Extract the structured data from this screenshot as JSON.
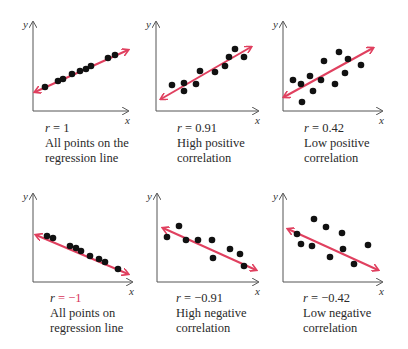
{
  "colors": {
    "regression_line": "#e0405f",
    "points": "#111111",
    "axes": "#555555",
    "accent_text": "#d8345a"
  },
  "chart_data": [
    {
      "type": "scatter",
      "title": "",
      "xlabel": "x",
      "ylabel": "y",
      "r_label": "r = 1",
      "r_value": 1,
      "caption": [
        "All points on the",
        "regression line"
      ],
      "regression": "positive, all points on line",
      "points": [
        [
          45,
          87
        ],
        [
          58,
          81
        ],
        [
          63,
          79
        ],
        [
          72,
          74
        ],
        [
          80,
          71
        ],
        [
          86,
          69
        ],
        [
          91,
          66
        ],
        [
          108,
          58
        ],
        [
          115,
          55
        ]
      ],
      "line": [
        [
          35,
          92
        ],
        [
          128,
          50
        ]
      ],
      "axes": {
        "origin": [
          33,
          111
        ],
        "ytop": 22,
        "xright": 128
      }
    },
    {
      "type": "scatter",
      "xlabel": "x",
      "ylabel": "y",
      "r_label": "r = 0.91",
      "r_value": 0.91,
      "caption": [
        "High positive",
        "correlation"
      ],
      "points": [
        [
          172,
          85
        ],
        [
          184,
          83
        ],
        [
          184,
          91
        ],
        [
          196,
          84
        ],
        [
          200,
          71
        ],
        [
          215,
          72
        ],
        [
          225,
          66
        ],
        [
          229,
          57
        ],
        [
          235,
          49
        ],
        [
          244,
          57
        ]
      ],
      "line": [
        [
          161,
          99
        ],
        [
          251,
          47
        ]
      ],
      "axes": {
        "origin": [
          156,
          111
        ],
        "ytop": 22,
        "xright": 258
      }
    },
    {
      "type": "scatter",
      "xlabel": "x",
      "ylabel": "y",
      "r_label": "r = 0.42",
      "r_value": 0.42,
      "caption": [
        "Low positive",
        "correlation"
      ],
      "points": [
        [
          293,
          80
        ],
        [
          301,
          84
        ],
        [
          302,
          102
        ],
        [
          310,
          76
        ],
        [
          313,
          91
        ],
        [
          321,
          80
        ],
        [
          324,
          61
        ],
        [
          335,
          84
        ],
        [
          339,
          52
        ],
        [
          345,
          73
        ],
        [
          348,
          59
        ],
        [
          361,
          65
        ]
      ],
      "line": [
        [
          284,
          97
        ],
        [
          373,
          48
        ]
      ],
      "axes": {
        "origin": [
          283,
          111
        ],
        "ytop": 22,
        "xright": 382
      }
    },
    {
      "type": "scatter",
      "xlabel": "x",
      "ylabel": "y",
      "r_label": "r = −1",
      "r_value": -1,
      "caption": [
        "All points on",
        "regression line"
      ],
      "points": [
        [
          47,
          236
        ],
        [
          53,
          238
        ],
        [
          70,
          246
        ],
        [
          76,
          248
        ],
        [
          81,
          251
        ],
        [
          90,
          256
        ],
        [
          99,
          259
        ],
        [
          105,
          262
        ],
        [
          118,
          269
        ]
      ],
      "line": [
        [
          36,
          235
        ],
        [
          128,
          274
        ]
      ],
      "axes": {
        "origin": [
          33,
          282
        ],
        "ytop": 194,
        "xright": 132
      }
    },
    {
      "type": "scatter",
      "xlabel": "x",
      "ylabel": "y",
      "r_label": "r = −0.91",
      "r_value": -0.91,
      "caption": [
        "High negative",
        "correlation"
      ],
      "points": [
        [
          167,
          237
        ],
        [
          179,
          226
        ],
        [
          186,
          240
        ],
        [
          198,
          240
        ],
        [
          212,
          240
        ],
        [
          213,
          258
        ],
        [
          230,
          249
        ],
        [
          240,
          254
        ],
        [
          244,
          266
        ]
      ],
      "line": [
        [
          163,
          228
        ],
        [
          256,
          270
        ]
      ],
      "axes": {
        "origin": [
          157,
          282
        ],
        "ytop": 194,
        "xright": 258
      }
    },
    {
      "type": "scatter",
      "xlabel": "x",
      "ylabel": "y",
      "r_label": "r = −0.42",
      "r_value": -0.42,
      "caption": [
        "Low negative",
        "correlation"
      ],
      "points": [
        [
          314,
          219
        ],
        [
          326,
          227
        ],
        [
          297,
          234
        ],
        [
          342,
          233
        ],
        [
          301,
          244
        ],
        [
          312,
          246
        ],
        [
          343,
          249
        ],
        [
          330,
          257
        ],
        [
          354,
          264
        ],
        [
          368,
          245
        ]
      ],
      "line": [
        [
          288,
          229
        ],
        [
          378,
          270
        ]
      ],
      "axes": {
        "origin": [
          283,
          282
        ],
        "ytop": 194,
        "xright": 382
      }
    }
  ],
  "captions": [
    {
      "r_var": "r",
      "r_eq": " = ",
      "r_num": "1",
      "line1": "All points on the",
      "line2": "regression line"
    },
    {
      "r_var": "r",
      "r_eq": " = ",
      "r_num": "0.91",
      "line1": "High positive",
      "line2": "correlation"
    },
    {
      "r_var": "r",
      "r_eq": " = ",
      "r_num": "0.42",
      "line1": "Low positive",
      "line2": "correlation"
    },
    {
      "r_var": "r",
      "r_eq": " = ",
      "r_num": "−1",
      "line1": "All points on",
      "line2": "regression line"
    },
    {
      "r_var": "r",
      "r_eq": " = ",
      "r_num": "−0.91",
      "line1": "High negative",
      "line2": "correlation"
    },
    {
      "r_var": "r",
      "r_eq": " = ",
      "r_num": "−0.42",
      "line1": "Low negative",
      "line2": "correlation"
    }
  ]
}
